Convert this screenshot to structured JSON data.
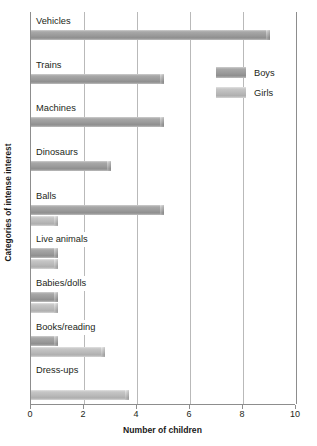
{
  "chart_data": {
    "type": "bar",
    "orientation": "horizontal",
    "title": "",
    "xlabel": "Number of children",
    "ylabel": "Categories of intense interest",
    "xlim": [
      0,
      10
    ],
    "xticks": [
      0,
      2,
      4,
      6,
      8,
      10
    ],
    "xticklabels": [
      "0",
      "2",
      "4",
      "6",
      "8",
      "10"
    ],
    "grid": true,
    "grid_axis": "x",
    "legend_position": "upper right",
    "categories": [
      "Vehicles",
      "Trains",
      "Machines",
      "Dinosaurs",
      "Balls",
      "Live animals",
      "Babies/dolls",
      "Books/reading",
      "Dress-ups"
    ],
    "series": [
      {
        "name": "Boys",
        "color": "#9a9a9a",
        "values": [
          9,
          5,
          5,
          3,
          5,
          1,
          1,
          1,
          0
        ]
      },
      {
        "name": "Girls",
        "color": "#b9b9b9",
        "values": [
          0,
          0,
          0,
          0,
          1,
          1,
          1,
          2.8,
          3.7
        ]
      }
    ]
  },
  "legend": {
    "items": [
      {
        "label": "Boys"
      },
      {
        "label": "Girls"
      }
    ]
  },
  "axes": {
    "x_title": "Number of children",
    "y_title": "Categories of intense interest"
  }
}
